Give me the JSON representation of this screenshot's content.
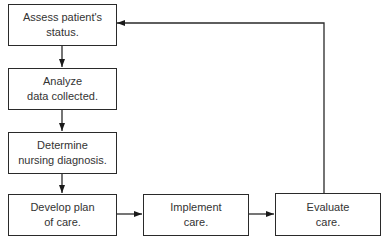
{
  "diagram": {
    "type": "flowchart",
    "colors": {
      "stroke": "#2a2a2a",
      "text": "#333333",
      "background": "#ffffff"
    },
    "nodes": [
      {
        "id": "assess",
        "label": "Assess patient's\nstatus."
      },
      {
        "id": "analyze",
        "label": "Analyze\ndata collected."
      },
      {
        "id": "determine",
        "label": "Determine\nnursing diagnosis."
      },
      {
        "id": "develop",
        "label": "Develop plan\nof care."
      },
      {
        "id": "implement",
        "label": "Implement\ncare."
      },
      {
        "id": "evaluate",
        "label": "Evaluate\ncare."
      }
    ],
    "edges": [
      {
        "from": "assess",
        "to": "analyze"
      },
      {
        "from": "analyze",
        "to": "determine"
      },
      {
        "from": "determine",
        "to": "develop"
      },
      {
        "from": "develop",
        "to": "implement"
      },
      {
        "from": "implement",
        "to": "evaluate"
      },
      {
        "from": "evaluate",
        "to": "assess"
      }
    ]
  }
}
